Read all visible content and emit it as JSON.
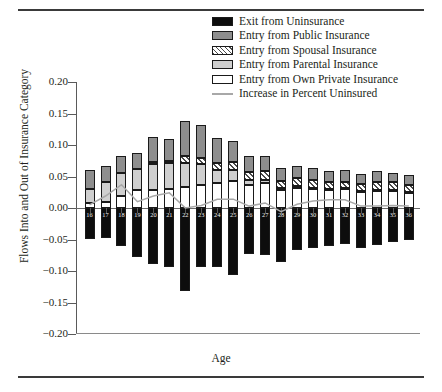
{
  "chart_data": {
    "type": "bar",
    "subtype": "stacked-bar-with-line",
    "title": "",
    "xlabel": "Age",
    "ylabel": "Flows Into and Out of Insurance Category",
    "ylim": [
      -0.2,
      0.2
    ],
    "yticks": [
      "0.20",
      "0.15",
      "0.10",
      "0.05",
      "0.00",
      "−0.05",
      "−0.10",
      "−0.15",
      "−0.20"
    ],
    "ytick_values": [
      0.2,
      0.15,
      0.1,
      0.05,
      0.0,
      -0.05,
      -0.1,
      -0.15,
      -0.2
    ],
    "grid": false,
    "legend_position": "top-right",
    "categories": [
      16,
      17,
      18,
      19,
      20,
      21,
      22,
      23,
      24,
      25,
      26,
      27,
      28,
      29,
      30,
      31,
      32,
      33,
      34,
      35,
      36
    ],
    "series": [
      {
        "name": "Exit from Uninsurance",
        "key": "exit_uninsurance",
        "color": "#0d0d0d",
        "fill": "solid",
        "values": [
          -0.049,
          -0.047,
          -0.06,
          -0.078,
          -0.089,
          -0.093,
          -0.131,
          -0.093,
          -0.093,
          -0.106,
          -0.073,
          -0.075,
          -0.085,
          -0.066,
          -0.064,
          -0.06,
          -0.057,
          -0.064,
          -0.059,
          -0.054,
          -0.05
        ]
      },
      {
        "name": "Entry from Own Private Insurance",
        "key": "own_private",
        "color": "#ffffff",
        "fill": "white",
        "values": [
          0.008,
          0.01,
          0.019,
          0.028,
          0.029,
          0.03,
          0.033,
          0.036,
          0.039,
          0.043,
          0.036,
          0.039,
          0.028,
          0.032,
          0.03,
          0.028,
          0.03,
          0.026,
          0.028,
          0.028,
          0.025
        ]
      },
      {
        "name": "Entry from Parental Insurance",
        "key": "parental",
        "color": "#cfcfcf",
        "fill": "lightgray",
        "values": [
          0.022,
          0.032,
          0.036,
          0.034,
          0.041,
          0.041,
          0.038,
          0.034,
          0.021,
          0.018,
          0.009,
          0.006,
          0.004,
          0.003,
          0.002,
          0.002,
          0.001,
          0.001,
          0.001,
          0.001,
          0.001
        ]
      },
      {
        "name": "Entry from Spousal Insurance",
        "key": "spousal",
        "color": "#ffffff",
        "fill": "hatch",
        "values": [
          0.0,
          0.0,
          0.0,
          0.0,
          0.003,
          0.004,
          0.011,
          0.01,
          0.012,
          0.012,
          0.012,
          0.013,
          0.011,
          0.013,
          0.013,
          0.012,
          0.011,
          0.011,
          0.012,
          0.012,
          0.011
        ]
      },
      {
        "name": "Entry from Public Insurance",
        "key": "public",
        "color": "#8e8e8e",
        "fill": "gray",
        "values": [
          0.031,
          0.025,
          0.028,
          0.025,
          0.039,
          0.034,
          0.056,
          0.051,
          0.039,
          0.033,
          0.025,
          0.024,
          0.021,
          0.018,
          0.019,
          0.017,
          0.018,
          0.016,
          0.017,
          0.015,
          0.015
        ]
      }
    ],
    "line_series": {
      "name": "Increase in Percent Uninsured",
      "key": "increase_pct_uninsured",
      "color": "#a8a8a8",
      "values": [
        0.005,
        0.019,
        0.037,
        0.01,
        0.019,
        0.024,
        0.0,
        0.004,
        0.014,
        0.014,
        0.003,
        0.008,
        -0.006,
        0.006,
        0.011,
        0.013,
        0.013,
        0.003,
        0.003,
        0.004,
        0.003
      ]
    },
    "legend": [
      {
        "label": "Exit from Uninsurance",
        "swatch": "sw-black"
      },
      {
        "label": "Entry from Public Insurance",
        "swatch": "sw-gray"
      },
      {
        "label": "Entry from Spousal Insurance",
        "swatch": "sw-hatch"
      },
      {
        "label": "Entry from Parental Insurance",
        "swatch": "sw-lgray"
      },
      {
        "label": "Entry from Own Private Insurance",
        "swatch": "sw-white"
      },
      {
        "label": "Increase in Percent Uninsured",
        "swatch": "sw-line"
      }
    ]
  }
}
